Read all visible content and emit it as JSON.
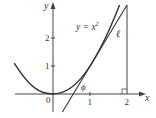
{
  "figure": {
    "curve_label_prefix": "y = x",
    "curve_label_exp": "2",
    "tangent_label": "ℓ",
    "angle_label": "ϕ",
    "axes": {
      "x_label": "x",
      "y_label": "y",
      "x_ticks": [
        "0",
        "1",
        "2"
      ],
      "y_ticks": [
        "1",
        "2"
      ]
    },
    "colors": {
      "ink": "#333333",
      "background": "#ffffff"
    }
  }
}
